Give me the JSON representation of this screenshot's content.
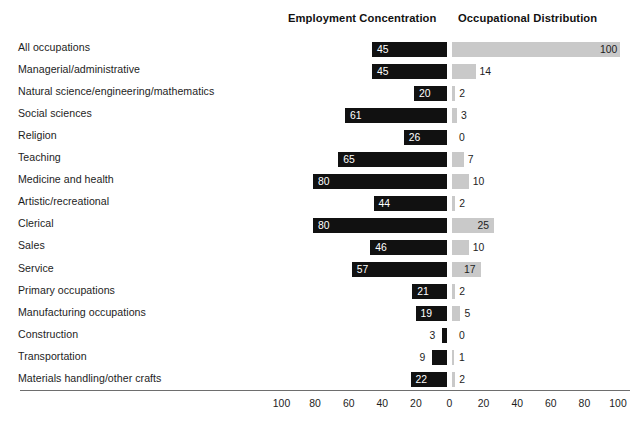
{
  "headers": {
    "left": "Employment Concentration",
    "right": "Occupational Distribution"
  },
  "axis": {
    "ticks": [
      100,
      80,
      60,
      40,
      20,
      0,
      20,
      40,
      60,
      80,
      100
    ],
    "center_value": 0,
    "max": 100
  },
  "colors": {
    "employment_bar": "#111111",
    "distribution_bar": "#c9c9c9",
    "text": "#1d1d1d",
    "axis_line": "#6e6e6e",
    "background": "#ffffff"
  },
  "chart_data": {
    "type": "bar",
    "title": "",
    "subtitle": "",
    "xlabel": "",
    "ylabel": "",
    "orientation": "horizontal",
    "style": "diverging-bidirectional",
    "grid": false,
    "legend_position": "top",
    "xlim": [
      0,
      100
    ],
    "axis_ticks": [
      100,
      80,
      60,
      40,
      20,
      0,
      20,
      40,
      60,
      80,
      100
    ],
    "categories": [
      "All occupations",
      "Managerial/administrative",
      "Natural science/engineering/mathematics",
      "Social sciences",
      "Religion",
      "Teaching",
      "Medicine and health",
      "Artistic/recreational",
      "Clerical",
      "Sales",
      "Service",
      "Primary occupations",
      "Manufacturing occupations",
      "Construction",
      "Transportation",
      "Materials handling/other crafts"
    ],
    "series": [
      {
        "name": "Employment Concentration",
        "direction": "left",
        "color": "#111111",
        "values": [
          45,
          45,
          20,
          61,
          26,
          65,
          80,
          44,
          80,
          46,
          57,
          21,
          19,
          3,
          9,
          22
        ]
      },
      {
        "name": "Occupational Distribution",
        "direction": "right",
        "color": "#c9c9c9",
        "values": [
          100,
          14,
          2,
          3,
          0,
          7,
          10,
          2,
          25,
          10,
          17,
          2,
          5,
          0,
          1,
          2
        ]
      }
    ]
  }
}
